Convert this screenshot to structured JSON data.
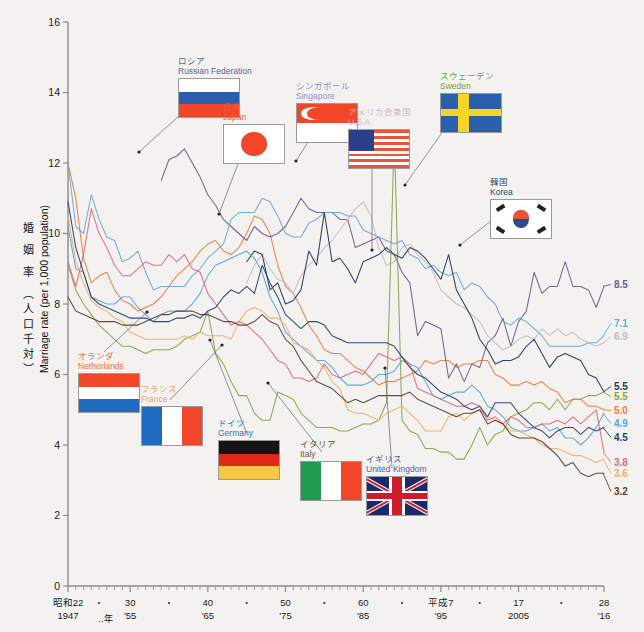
{
  "axis": {
    "y_label_jp": "婚 姻 率 （人口千対）",
    "y_label_en": "Marriage rate  (per 1,000 population)",
    "y_ticks": [
      "16",
      "14",
      "12",
      "10",
      "8",
      "6",
      "4",
      "2",
      "0"
    ],
    "y_values": [
      16,
      14,
      12,
      10,
      8,
      6,
      4,
      2,
      0
    ],
    "x_unit": "‥年",
    "x_ticks": [
      {
        "top": "昭和22",
        "bottom": "1947",
        "year": 1947
      },
      {
        "top": "30",
        "bottom": "'55",
        "year": 1955
      },
      {
        "top": "40",
        "bottom": "'65",
        "year": 1965
      },
      {
        "top": "50",
        "bottom": "'75",
        "year": 1975
      },
      {
        "top": "60",
        "bottom": "'85",
        "year": 1985
      },
      {
        "top": "平成7",
        "bottom": "'95",
        "year": 1995
      },
      {
        "top": "17",
        "bottom": "2005",
        "year": 2005
      },
      {
        "top": "28",
        "bottom": "'16",
        "year": 2016
      }
    ]
  },
  "legend": [
    {
      "key": "russia",
      "jp": "ロシア",
      "en": "Russian Federation",
      "color": "#5c5f9c",
      "flag": "ru",
      "x": 178,
      "y": 57,
      "fw": 62,
      "fh": 40
    },
    {
      "key": "japan",
      "jp": "日本",
      "en": "Japan",
      "color": "#f05a28",
      "flag": "jp",
      "x": 223,
      "y": 103,
      "fw": 62,
      "fh": 40
    },
    {
      "key": "singapore",
      "jp": "シンガポール",
      "en": "Singapore",
      "color": "#8b8fc4",
      "flag": "sg",
      "x": 296,
      "y": 82,
      "fw": 62,
      "fh": 40
    },
    {
      "key": "usa",
      "jp": "アメリカ合衆国",
      "en": "U.S.A.",
      "color": "#c9b7c9",
      "flag": "us",
      "x": 348,
      "y": 108,
      "fw": 62,
      "fh": 40
    },
    {
      "key": "sweden",
      "jp": "スウェーデン",
      "en": "Sweden",
      "color": "#6f9e4e",
      "flag": "se",
      "x": 440,
      "y": 72,
      "fw": 62,
      "fh": 40
    },
    {
      "key": "korea",
      "jp": "韓国",
      "en": "Korea",
      "color": "#24506b",
      "flag": "kr",
      "x": 490,
      "y": 178,
      "fw": 62,
      "fh": 40
    },
    {
      "key": "netherlands",
      "jp": "オランダ",
      "en": "Netherlands",
      "color": "#e8724d",
      "flag": "nl",
      "x": 78,
      "y": 352,
      "fw": 62,
      "fh": 40
    },
    {
      "key": "france",
      "jp": "フランス",
      "en": "France",
      "color": "#e8a85a",
      "flag": "fr",
      "x": 141,
      "y": 385,
      "fw": 62,
      "fh": 40
    },
    {
      "key": "germany",
      "jp": "ドイツ",
      "en": "Germany",
      "color": "#2f79c4",
      "flag": "de",
      "x": 218,
      "y": 419,
      "fw": 62,
      "fh": 40
    },
    {
      "key": "italy",
      "jp": "イタリア",
      "en": "Italy",
      "color": "#6a5a3c",
      "flag": "it",
      "x": 300,
      "y": 440,
      "fw": 62,
      "fh": 40
    },
    {
      "key": "uk",
      "jp": "イギリス",
      "en": "United Kingdom",
      "color": "#4a5fa8",
      "flag": "gb",
      "x": 366,
      "y": 455,
      "fw": 62,
      "fh": 40
    }
  ],
  "end_labels": [
    {
      "key": "russia",
      "text": "8.5",
      "value": 8.5,
      "color": "#6b5d8f"
    },
    {
      "key": "usa",
      "text": "7.1",
      "value": 7.1,
      "color": "#6fa8d6"
    },
    {
      "key": "singapore",
      "text": "6.9",
      "value": 6.9,
      "color": "#cbb9c5"
    },
    {
      "key": "korea",
      "text": "5.5",
      "value": 5.5,
      "color": "#213a57"
    },
    {
      "key": "sweden",
      "text": "5.5",
      "value": 5.5,
      "color": "#8aa24d"
    },
    {
      "key": "japan",
      "text": "5.0",
      "value": 5.0,
      "color": "#ef7b3e"
    },
    {
      "key": "netherlands",
      "text": "4.9",
      "value": 4.9,
      "color": "#5ba3dd"
    },
    {
      "key": "uk",
      "text": "4.5",
      "value": 4.5,
      "color": "#2b3f77"
    },
    {
      "key": "germany",
      "text": "3.8",
      "value": 3.8,
      "color": "#e0697e"
    },
    {
      "key": "france",
      "text": "3.6",
      "value": 3.6,
      "color": "#f0b06a"
    },
    {
      "key": "italy",
      "text": "3.2",
      "value": 3.2,
      "color": "#5e4230"
    }
  ],
  "chart_data": {
    "type": "line",
    "title": "",
    "xlabel": "年",
    "ylabel": "婚姻率（人口千対） / Marriage rate (per 1,000 population)",
    "xlim": [
      1947,
      2016
    ],
    "ylim": [
      0,
      16
    ],
    "ytick_step": 2,
    "grid": false,
    "legend_position": "in-plot flag callouts",
    "x": [
      1947,
      1948,
      1949,
      1950,
      1951,
      1952,
      1953,
      1954,
      1955,
      1956,
      1957,
      1958,
      1959,
      1960,
      1961,
      1962,
      1963,
      1964,
      1965,
      1966,
      1967,
      1968,
      1969,
      1970,
      1971,
      1972,
      1973,
      1974,
      1975,
      1976,
      1977,
      1978,
      1979,
      1980,
      1981,
      1982,
      1983,
      1984,
      1985,
      1986,
      1987,
      1988,
      1989,
      1990,
      1991,
      1992,
      1993,
      1994,
      1995,
      1996,
      1997,
      1998,
      1999,
      2000,
      2001,
      2002,
      2003,
      2004,
      2005,
      2006,
      2007,
      2008,
      2009,
      2010,
      2011,
      2012,
      2013,
      2014,
      2015,
      2016
    ],
    "series": [
      {
        "name": "日本 / Japan",
        "key": "japan",
        "color": "#ef7b3e",
        "end_value": 5.0,
        "values": [
          12.0,
          11.0,
          9.3,
          8.6,
          8.8,
          8.9,
          8.4,
          8.1,
          8.0,
          7.8,
          7.9,
          8.0,
          8.2,
          8.5,
          8.8,
          9.0,
          9.2,
          9.5,
          9.7,
          9.8,
          9.5,
          9.4,
          9.6,
          10.0,
          10.5,
          10.4,
          10.0,
          9.1,
          8.5,
          8.3,
          7.9,
          7.4,
          7.1,
          6.7,
          6.6,
          6.6,
          6.4,
          6.2,
          6.1,
          5.9,
          5.7,
          5.8,
          5.8,
          5.9,
          6.0,
          6.1,
          6.4,
          6.3,
          6.4,
          6.4,
          6.2,
          6.3,
          6.3,
          6.4,
          6.4,
          6.0,
          5.9,
          5.7,
          5.7,
          5.8,
          5.7,
          5.8,
          5.6,
          5.5,
          5.2,
          5.3,
          5.3,
          5.1,
          5.1,
          5.0
        ]
      },
      {
        "name": "ロシア / Russian Federation",
        "key": "russia",
        "color": "#6b5d8f",
        "end_value": 8.5,
        "values": [
          null,
          null,
          null,
          null,
          null,
          null,
          null,
          null,
          null,
          null,
          null,
          null,
          11.5,
          12.1,
          12.2,
          12.4,
          12.0,
          11.6,
          11.1,
          10.8,
          10.4,
          10.2,
          10.0,
          9.8,
          10.2,
          10.0,
          9.9,
          10.0,
          10.2,
          10.6,
          11.0,
          10.7,
          10.6,
          10.6,
          10.6,
          10.4,
          10.4,
          9.6,
          9.7,
          9.8,
          9.9,
          9.5,
          9.4,
          8.9,
          8.6,
          7.1,
          7.5,
          7.4,
          7.3,
          5.9,
          6.3,
          5.8,
          6.3,
          6.2,
          6.9,
          7.1,
          7.6,
          6.8,
          7.5,
          7.8,
          8.9,
          8.3,
          8.5,
          8.5,
          9.2,
          8.5,
          8.5,
          8.4,
          7.9,
          8.5
        ]
      },
      {
        "name": "シンガポール / Singapore",
        "key": "singapore",
        "color": "#cbb9c5",
        "end_value": 6.9,
        "values": [
          null,
          null,
          null,
          null,
          null,
          null,
          null,
          null,
          null,
          null,
          null,
          null,
          null,
          null,
          null,
          null,
          null,
          null,
          null,
          null,
          null,
          null,
          null,
          8.6,
          9.1,
          9.4,
          9.0,
          8.7,
          8.6,
          8.3,
          8.8,
          9.1,
          9.3,
          9.6,
          9.8,
          10.1,
          10.4,
          10.7,
          10.9,
          10.5,
          9.6,
          9.1,
          9.2,
          9.6,
          9.7,
          9.4,
          9.2,
          8.9,
          8.4,
          8.2,
          8.0,
          7.9,
          7.7,
          7.5,
          7.1,
          6.9,
          6.7,
          6.8,
          7.0,
          7.1,
          7.0,
          7.3,
          7.1,
          7.3,
          7.1,
          7.2,
          7.0,
          6.9,
          6.8,
          6.9
        ]
      },
      {
        "name": "アメリカ合衆国 / U.S.A.",
        "key": "usa",
        "color": "#6fa8d6",
        "end_value": 7.1,
        "values": [
          12.0,
          10.2,
          10.0,
          11.1,
          10.4,
          9.9,
          9.8,
          9.2,
          9.3,
          9.5,
          8.9,
          8.4,
          8.5,
          8.5,
          8.5,
          8.5,
          8.8,
          9.0,
          9.3,
          9.5,
          9.7,
          10.4,
          10.6,
          10.6,
          10.6,
          11.0,
          10.9,
          10.5,
          10.0,
          9.9,
          9.9,
          10.3,
          10.4,
          10.6,
          10.6,
          10.6,
          10.5,
          10.5,
          10.1,
          10.0,
          9.9,
          9.8,
          9.7,
          9.8,
          9.4,
          9.3,
          9.0,
          9.1,
          8.9,
          8.8,
          8.9,
          8.4,
          8.6,
          8.5,
          8.2,
          8.0,
          7.5,
          7.4,
          7.6,
          7.5,
          7.3,
          7.1,
          6.8,
          6.8,
          6.8,
          6.8,
          6.8,
          6.9,
          6.9,
          7.1
        ]
      },
      {
        "name": "スウェーデン / Sweden",
        "key": "sweden",
        "color": "#8aa24d",
        "end_value": 5.5,
        "values": [
          9.1,
          8.4,
          8.0,
          7.7,
          7.4,
          7.2,
          7.0,
          6.8,
          6.8,
          6.7,
          6.6,
          6.7,
          6.7,
          6.7,
          6.8,
          7.0,
          7.1,
          7.2,
          7.8,
          6.6,
          6.3,
          5.8,
          5.4,
          5.4,
          4.9,
          4.7,
          4.7,
          5.5,
          5.4,
          5.3,
          4.9,
          4.7,
          4.5,
          4.5,
          4.5,
          4.4,
          4.4,
          4.5,
          4.6,
          4.6,
          4.7,
          5.2,
          12.8,
          4.7,
          4.4,
          4.3,
          3.9,
          3.9,
          3.8,
          3.8,
          3.6,
          3.6,
          4.0,
          4.5,
          4.0,
          4.3,
          4.4,
          4.8,
          4.9,
          5.0,
          5.2,
          5.2,
          5.0,
          5.3,
          5.0,
          5.3,
          5.3,
          5.4,
          5.4,
          5.5
        ]
      },
      {
        "name": "韓国 / Korea",
        "key": "korea",
        "color": "#213a57",
        "end_value": 5.5,
        "values": [
          null,
          null,
          null,
          null,
          null,
          null,
          null,
          null,
          null,
          null,
          null,
          null,
          null,
          null,
          null,
          null,
          null,
          null,
          null,
          null,
          null,
          null,
          null,
          9.2,
          9.5,
          9.4,
          8.4,
          8.6,
          8.0,
          8.1,
          8.4,
          9.5,
          9.1,
          10.6,
          9.2,
          9.3,
          9.0,
          8.6,
          9.2,
          9.3,
          9.4,
          9.6,
          9.4,
          9.3,
          9.6,
          9.5,
          9.3,
          9.0,
          8.7,
          9.4,
          8.4,
          8.0,
          7.6,
          7.0,
          6.7,
          6.3,
          6.4,
          6.4,
          6.5,
          6.8,
          7.0,
          6.6,
          6.2,
          6.5,
          6.6,
          6.5,
          6.4,
          6.0,
          5.9,
          5.5
        ]
      },
      {
        "name": "オランダ / Netherlands",
        "key": "netherlands",
        "color": "#5ba3dd",
        "end_value": 4.9,
        "values": [
          10.2,
          9.0,
          8.9,
          8.2,
          8.1,
          8.0,
          8.0,
          8.2,
          8.2,
          7.9,
          7.7,
          7.5,
          7.7,
          7.8,
          7.8,
          7.8,
          8.0,
          8.3,
          8.8,
          9.1,
          9.2,
          9.3,
          9.4,
          9.5,
          9.3,
          8.9,
          8.2,
          7.8,
          7.2,
          7.0,
          6.8,
          6.6,
          6.4,
          6.4,
          6.2,
          5.9,
          5.7,
          5.7,
          5.7,
          5.8,
          6.0,
          6.0,
          6.1,
          6.4,
          6.3,
          6.2,
          5.8,
          5.4,
          5.3,
          5.4,
          5.5,
          5.5,
          5.7,
          5.5,
          5.1,
          5.0,
          4.8,
          4.5,
          4.4,
          4.4,
          4.5,
          4.6,
          4.4,
          4.5,
          4.2,
          4.2,
          4.0,
          4.2,
          4.5,
          4.9
        ]
      },
      {
        "name": "フランス / France",
        "key": "france",
        "color": "#f0b06a",
        "end_value": 3.6,
        "values": [
          10.5,
          9.2,
          8.6,
          8.1,
          7.9,
          7.8,
          7.6,
          7.5,
          7.2,
          7.1,
          7.0,
          7.0,
          7.0,
          7.0,
          7.0,
          7.1,
          7.0,
          7.2,
          7.1,
          7.1,
          7.1,
          7.0,
          7.5,
          7.8,
          7.9,
          7.8,
          7.6,
          7.6,
          7.4,
          6.9,
          6.8,
          6.7,
          6.4,
          6.2,
          5.8,
          5.6,
          5.0,
          4.9,
          4.9,
          4.8,
          4.7,
          4.9,
          5.0,
          5.1,
          4.9,
          4.7,
          4.4,
          4.4,
          4.4,
          4.8,
          4.9,
          4.7,
          4.9,
          5.0,
          4.8,
          4.7,
          4.6,
          4.4,
          4.4,
          4.3,
          4.2,
          4.0,
          3.9,
          3.9,
          3.8,
          3.7,
          3.7,
          3.6,
          3.5,
          3.6
        ]
      },
      {
        "name": "ドイツ / Germany",
        "key": "germany",
        "color": "#e0697e",
        "end_value": 3.8,
        "values": [
          9.2,
          8.5,
          9.4,
          10.7,
          10.0,
          9.6,
          9.1,
          8.8,
          8.8,
          9.0,
          9.2,
          9.1,
          9.1,
          9.4,
          9.2,
          9.4,
          9.0,
          8.9,
          8.3,
          8.0,
          7.7,
          7.4,
          7.5,
          7.4,
          7.2,
          7.0,
          6.7,
          6.4,
          6.3,
          5.9,
          5.9,
          5.8,
          5.9,
          6.3,
          6.0,
          5.9,
          6.0,
          6.1,
          6.0,
          6.3,
          6.6,
          6.5,
          6.4,
          6.5,
          6.3,
          5.6,
          5.5,
          5.4,
          5.3,
          5.2,
          5.1,
          5.1,
          5.2,
          5.1,
          4.7,
          4.8,
          4.6,
          4.8,
          4.7,
          4.5,
          4.5,
          4.6,
          4.6,
          4.7,
          4.6,
          4.8,
          4.6,
          4.8,
          5.0,
          3.8
        ]
      },
      {
        "name": "イタリア / Italy",
        "key": "italy",
        "color": "#5e4230",
        "end_value": 3.2,
        "values": [
          8.2,
          7.8,
          7.7,
          7.6,
          7.5,
          7.5,
          7.5,
          7.4,
          7.4,
          7.4,
          7.5,
          7.6,
          7.7,
          7.7,
          7.8,
          7.8,
          7.8,
          7.7,
          7.7,
          7.6,
          7.5,
          7.5,
          7.4,
          7.4,
          7.5,
          7.7,
          7.5,
          7.4,
          7.0,
          6.8,
          6.4,
          6.1,
          5.8,
          5.7,
          5.6,
          5.4,
          5.2,
          5.3,
          5.2,
          5.3,
          5.4,
          5.4,
          5.4,
          5.4,
          5.5,
          5.3,
          5.2,
          5.1,
          5.0,
          4.9,
          4.8,
          4.9,
          4.9,
          5.0,
          4.6,
          4.7,
          4.6,
          4.3,
          4.2,
          4.2,
          4.2,
          4.1,
          3.9,
          3.7,
          3.4,
          3.5,
          3.2,
          3.1,
          3.2,
          3.2
        ]
      },
      {
        "name": "イギリス / United Kingdom",
        "key": "uk",
        "color": "#2b3f77",
        "end_value": 4.5,
        "values": [
          10.9,
          9.6,
          8.9,
          8.2,
          8.0,
          7.9,
          7.8,
          7.7,
          7.6,
          7.6,
          7.6,
          7.5,
          7.5,
          7.5,
          7.6,
          7.6,
          7.7,
          7.6,
          7.8,
          7.9,
          8.2,
          8.4,
          8.3,
          8.5,
          8.3,
          9.1,
          8.6,
          8.2,
          7.7,
          7.5,
          7.3,
          7.5,
          7.5,
          7.4,
          7.1,
          7.0,
          6.9,
          6.9,
          6.9,
          6.9,
          6.9,
          6.9,
          6.8,
          6.5,
          6.2,
          6.0,
          5.9,
          5.7,
          5.5,
          5.4,
          5.3,
          5.1,
          5.0,
          5.1,
          4.8,
          5.2,
          5.2,
          5.2,
          4.9,
          4.7,
          4.5,
          4.4,
          4.2,
          4.4,
          4.5,
          4.5,
          4.3,
          4.5,
          4.4,
          4.5
        ]
      }
    ]
  }
}
